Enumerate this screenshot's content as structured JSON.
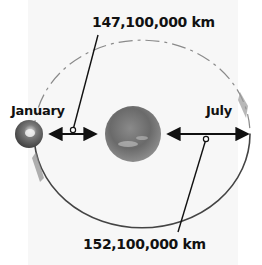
{
  "diagram": {
    "labels": {
      "perihelion_distance": "147,100,000 km",
      "aphelion_distance": "152,100,000 km",
      "january": "January",
      "july": "July"
    },
    "bodies": [
      {
        "name": "Sun",
        "position": "center"
      },
      {
        "name": "Earth",
        "position": "left of orbit (January)"
      }
    ],
    "colors": {
      "sun": "#6e6e6e",
      "earth": "#5a5a5a",
      "orbit_line": "#555555",
      "arrow": "#111111",
      "text": "#111111",
      "background": "#f7f7f7"
    }
  }
}
